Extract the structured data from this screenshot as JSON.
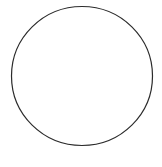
{
  "canvas": {
    "width": 162,
    "height": 167,
    "background": "#ffffff"
  },
  "shapes": [
    {
      "type": "ellipse",
      "cx": 82,
      "cy": 76,
      "rx": 70.5,
      "ry": 69.5,
      "stroke": "#2b2b2b",
      "stroke_width": 1.2,
      "fill": "none"
    }
  ]
}
